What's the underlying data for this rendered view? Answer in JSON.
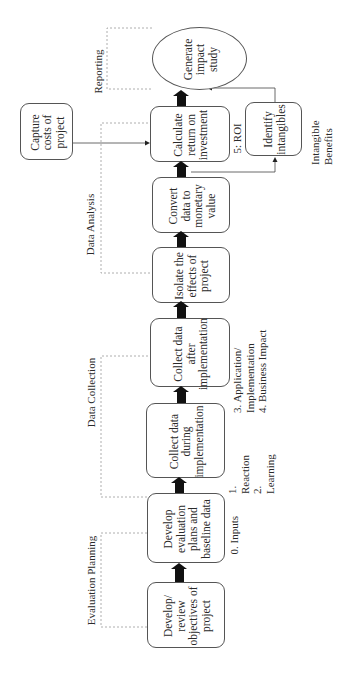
{
  "diagram": {
    "orientation": "rotated-90-ccw",
    "phases": [
      {
        "id": "evaluation-planning",
        "label": "Evaluation Planning"
      },
      {
        "id": "data-collection",
        "label": "Data Collection"
      },
      {
        "id": "data-analysis",
        "label": "Data Analysis"
      },
      {
        "id": "reporting",
        "label": "Reporting"
      }
    ],
    "steps": [
      {
        "id": "develop-review-objectives",
        "label": "Develop/\nreview\nobjectives of\nproject"
      },
      {
        "id": "develop-evaluation-plans",
        "label": "Develop\nevaluation\nplans and\nbaseline data"
      },
      {
        "id": "collect-data-during",
        "label": "Collect data\nduring\nimplementation"
      },
      {
        "id": "collect-data-after",
        "label": "Collect data\nafter\nimplementation"
      },
      {
        "id": "isolate-effects",
        "label": "Isolate the\neffects of\nproject"
      },
      {
        "id": "convert-data",
        "label": "Convert\ndata to\nmonetary\nvalue"
      },
      {
        "id": "calculate-roi",
        "label": "Calculate\nreturn on\ninvestment"
      },
      {
        "id": "generate-impact-study",
        "label": "Generate\nimpact\nstudy"
      }
    ],
    "side_boxes": [
      {
        "id": "capture-costs",
        "label": "Capture\ncosts of\nproject"
      },
      {
        "id": "identify-intangibles",
        "label": "Identify\nintangibles"
      }
    ],
    "level_labels": [
      {
        "id": "inputs",
        "label": "0. Inputs"
      },
      {
        "id": "reaction-learning",
        "label": "1. Reaction\n2. Learning"
      },
      {
        "id": "application-impact",
        "label": "3. Application/\n    Implementation\n4. Business Impact"
      },
      {
        "id": "roi",
        "label": "5: ROI"
      },
      {
        "id": "intangible-benefits",
        "label": "Intangible\nBenefits"
      }
    ]
  }
}
